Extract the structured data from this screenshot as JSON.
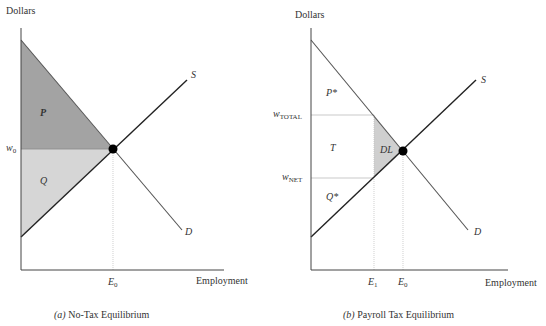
{
  "panels": [
    {
      "id": "a",
      "y_axis_label": "Dollars",
      "x_axis_label": "Employment",
      "caption_letter": "(a)",
      "caption_text": " No-Tax Equilibrium",
      "supply_label": "S",
      "demand_label": "D",
      "wage_label": "w",
      "wage_sub": "0",
      "emp_label": "E",
      "emp_sub": "0",
      "regions": {
        "upper": "P",
        "lower": "Q"
      }
    },
    {
      "id": "b",
      "y_axis_label": "Dollars",
      "x_axis_label": "Employment",
      "caption_letter": "(b)",
      "caption_text": " Payroll Tax Equilibrium",
      "supply_label": "S",
      "demand_label": "D",
      "wage_total_label": "w",
      "wage_total_sub": "TOTAL",
      "wage_net_label": "w",
      "wage_net_sub": "NET",
      "emp1_label": "E",
      "emp1_sub": "1",
      "emp0_label": "E",
      "emp0_sub": "0",
      "regions": {
        "upper": "P*",
        "middle": "T",
        "deadweight": "DL",
        "lower": "Q*"
      }
    }
  ],
  "colors": {
    "dark_fill": "#a3a3a3",
    "light_fill": "#d6d6d6",
    "dl_fill": "#cfcfcf",
    "line": "#2a2a2a",
    "demand_line": "#555555",
    "guide": "#bbbbbb"
  }
}
